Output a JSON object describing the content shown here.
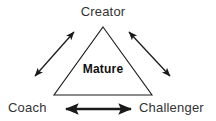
{
  "diagram": {
    "type": "triangle-relationship",
    "center_label": "Mature",
    "nodes": [
      {
        "id": "creator",
        "label": "Creator",
        "position": "top"
      },
      {
        "id": "coach",
        "label": "Coach",
        "position": "bottom-left"
      },
      {
        "id": "challenger",
        "label": "Challenger",
        "position": "bottom-right"
      }
    ],
    "connectors": [
      {
        "id": "coach-creator",
        "from": "Coach",
        "to": "Creator",
        "style": "double-arrow"
      },
      {
        "id": "creator-challenger",
        "from": "Creator",
        "to": "Challenger",
        "style": "double-arrow"
      },
      {
        "id": "coach-challenger",
        "from": "Coach",
        "to": "Challenger",
        "style": "double-arrow"
      }
    ],
    "colors": {
      "stroke": "#1a1a1a",
      "label": "#333333",
      "center_label": "#111111",
      "background": "#ffffff"
    }
  }
}
